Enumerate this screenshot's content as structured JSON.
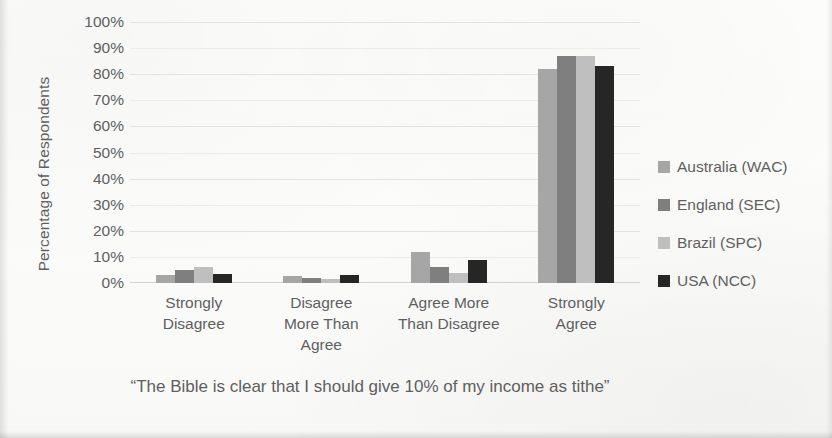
{
  "chart_data": {
    "type": "bar",
    "title": "",
    "subtitle": "",
    "xlabel": "“The Bible is clear that I should give 10% of my income as tithe”",
    "ylabel": "Percentage of Respondents",
    "categories": [
      "Strongly Disagree",
      "Disagree More Than Agree",
      "Agree More Than Disagree",
      "Strongly Agree"
    ],
    "category_lines": [
      [
        "Strongly",
        "Disagree"
      ],
      [
        "Disagree",
        "More Than",
        "Agree"
      ],
      [
        "Agree More",
        "Than Disagree"
      ],
      [
        "Strongly",
        "Agree"
      ]
    ],
    "series": [
      {
        "name": "Australia (WAC)",
        "color": "#a6a6a6",
        "values": [
          3,
          2.5,
          12,
          82
        ]
      },
      {
        "name": "England (SEC)",
        "color": "#7f7f7f",
        "values": [
          5,
          2,
          6,
          87
        ]
      },
      {
        "name": "Brazil (SPC)",
        "color": "#bfbfbf",
        "values": [
          6,
          1.5,
          4,
          87
        ]
      },
      {
        "name": "USA (NCC)",
        "color": "#262626",
        "values": [
          3.5,
          3,
          9,
          83
        ]
      }
    ],
    "ylim": [
      0,
      100
    ],
    "ytick_labels": [
      "100%",
      "90%",
      "80%",
      "70%",
      "60%",
      "50%",
      "40%",
      "30%",
      "20%",
      "10%",
      "0%"
    ],
    "ytick_values": [
      100,
      90,
      80,
      70,
      60,
      50,
      40,
      30,
      20,
      10,
      0
    ],
    "ytick_step": 10,
    "grid": true,
    "grid_axis": "y",
    "legend_position": "right",
    "background_color": "#fbfbfa",
    "text_color": "#5f5f5f",
    "gridline_color": "#e2e2e0"
  }
}
